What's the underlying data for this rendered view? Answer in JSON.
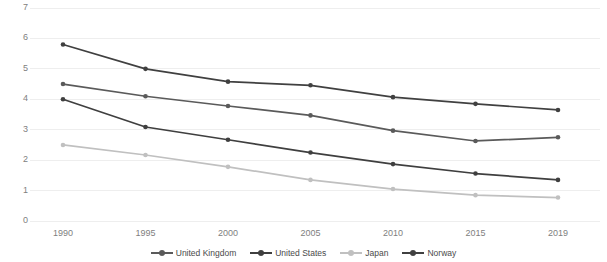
{
  "chart_data": {
    "type": "line",
    "title": "",
    "subtitle": "",
    "xlabel": "",
    "ylabel": "",
    "categories": [
      "1990",
      "1995",
      "2000",
      "2005",
      "2010",
      "2015",
      "2019"
    ],
    "x_tick_labels": [
      "1990",
      "1995",
      "2000",
      "2005",
      "2010",
      "2015",
      "2019"
    ],
    "y_tick_labels": [
      "0",
      "1",
      "2",
      "3",
      "4",
      "5",
      "6",
      "7"
    ],
    "y_tick_values": [
      0,
      1,
      2,
      3,
      4,
      5,
      6,
      7
    ],
    "ylim": [
      0,
      7
    ],
    "grid": "horizontal",
    "legend_position": "bottom",
    "series": [
      {
        "name": "United Kingdom",
        "color": "#5a5a5a",
        "values": [
          4.5,
          4.1,
          3.78,
          3.47,
          2.97,
          2.63,
          2.75
        ]
      },
      {
        "name": "United States",
        "color": "#3f3f3f",
        "values": [
          4.0,
          3.09,
          2.67,
          2.25,
          1.87,
          1.56,
          1.35
        ]
      },
      {
        "name": "Japan",
        "color": "#c0c0c0",
        "values": [
          2.5,
          2.17,
          1.78,
          1.35,
          1.05,
          0.85,
          0.77
        ]
      },
      {
        "name": "Norway",
        "color": "#404040",
        "values": [
          5.8,
          5.0,
          4.58,
          4.46,
          4.07,
          3.85,
          3.65
        ]
      }
    ]
  },
  "axes": {
    "gridline_color": "#eeeeee",
    "tick_text_color": "#808080"
  },
  "legend": {
    "entries": [
      "United Kingdom",
      "United States",
      "Japan",
      "Norway"
    ]
  }
}
